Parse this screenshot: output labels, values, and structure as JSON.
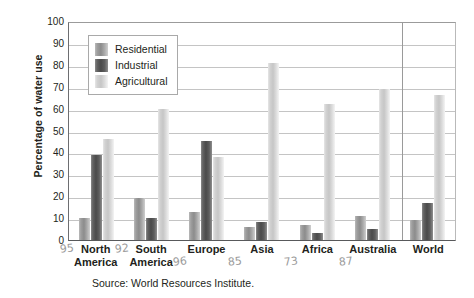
{
  "chart_data": {
    "type": "bar",
    "title": "",
    "xlabel": "",
    "ylabel": "Percentage of water use",
    "ylim": [
      0,
      100
    ],
    "ytick_step": 10,
    "yticks": [
      100,
      90,
      80,
      70,
      60,
      50,
      40,
      30,
      20,
      10,
      0
    ],
    "grid": true,
    "legend_position": "top-left-inside",
    "categories": [
      "North America",
      "South America",
      "Europe",
      "Asia",
      "Africa",
      "Australia",
      "World"
    ],
    "series": [
      {
        "name": "Residential",
        "color": "#9e9e9e",
        "values": [
          10,
          19,
          13,
          6,
          7,
          11,
          9
        ]
      },
      {
        "name": "Industrial",
        "color": "#4a4a4a",
        "values": [
          39,
          10,
          45,
          8,
          3,
          5,
          17
        ]
      },
      {
        "name": "Agricultural",
        "color": "#d2d2d2",
        "values": [
          46,
          60,
          38,
          81,
          62,
          69,
          66
        ]
      }
    ],
    "annotations": [
      {
        "text": "95",
        "near": "North America"
      },
      {
        "text": "92",
        "near": "South America"
      },
      {
        "text": "96",
        "near": "Europe"
      },
      {
        "text": "85",
        "near": "Asia"
      },
      {
        "text": "73",
        "near": "Africa"
      },
      {
        "text": "87",
        "near": "Australia"
      }
    ],
    "source": "Source: World Resources Institute."
  },
  "cat_lines": {
    "north_america": [
      "North",
      "America"
    ],
    "south_america": [
      "South",
      "America"
    ],
    "europe": [
      "Europe",
      ""
    ],
    "asia": [
      "Asia",
      ""
    ],
    "africa": [
      "Africa",
      ""
    ],
    "australia": [
      "Australia",
      ""
    ],
    "world": [
      "World",
      ""
    ]
  }
}
